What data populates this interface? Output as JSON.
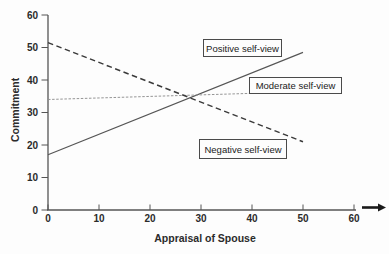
{
  "figure": {
    "background": "#fdfdfd",
    "axis_color": "#555555",
    "text_color": "#2b2b2b",
    "x_axis_arrow_icon": "right-arrow"
  },
  "chart_data": {
    "type": "line",
    "title": "",
    "xlabel": "Appraisal of Spouse",
    "ylabel": "Commitment",
    "xlim": [
      0,
      62
    ],
    "ylim": [
      0,
      60
    ],
    "x_ticks": [
      0,
      10,
      20,
      30,
      40,
      50,
      60
    ],
    "y_ticks": [
      0,
      10,
      20,
      30,
      40,
      50,
      60
    ],
    "grid": false,
    "legend_position": "inline-boxed-labels",
    "series": [
      {
        "name": "Positive self-view",
        "style": "solid",
        "color": "#555555",
        "points": [
          [
            0,
            17
          ],
          [
            50,
            48.5
          ]
        ]
      },
      {
        "name": "Moderate self-view",
        "style": "dotted",
        "color": "#8f8f8f",
        "points": [
          [
            0,
            34
          ],
          [
            48.5,
            36.3
          ]
        ]
      },
      {
        "name": "Negative self-view",
        "style": "dashed",
        "color": "#3a3a3a",
        "points": [
          [
            0,
            51.5
          ],
          [
            50,
            21
          ]
        ]
      }
    ]
  }
}
